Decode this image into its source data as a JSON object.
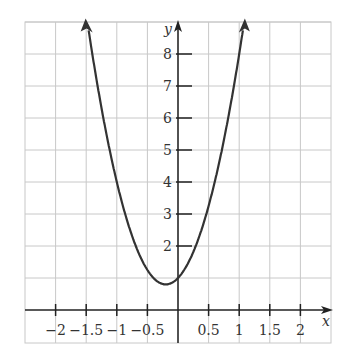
{
  "chart_data": {
    "type": "line",
    "title": "",
    "xlabel": "x",
    "ylabel": "y",
    "function": "y = 5x^2 + 2x + 1",
    "xlim": [
      -2.4,
      2.5
    ],
    "ylim": [
      -0.5,
      9
    ],
    "grid": true,
    "x_ticks": [
      -2,
      -1.5,
      -1,
      -0.5,
      0.5,
      1,
      1.5,
      2
    ],
    "x_tick_labels": [
      "−2",
      "−1.5",
      "−1",
      "−0.5",
      "0.5",
      "1",
      "1.5",
      "2"
    ],
    "y_ticks": [
      2,
      3,
      4,
      5,
      6,
      7,
      8
    ],
    "y_tick_labels": [
      "2",
      "3",
      "4",
      "5",
      "6",
      "7",
      "8"
    ],
    "series": [
      {
        "name": "parabola",
        "coeffs": [
          5,
          2,
          1
        ],
        "x_range": [
          -1.5,
          1.1
        ],
        "vertex": [
          -0.2,
          0.8
        ],
        "y_intercept": 1
      }
    ],
    "colors": {
      "curve": "#333333",
      "grid": "#c8c8c8",
      "axis": "#222222"
    }
  }
}
